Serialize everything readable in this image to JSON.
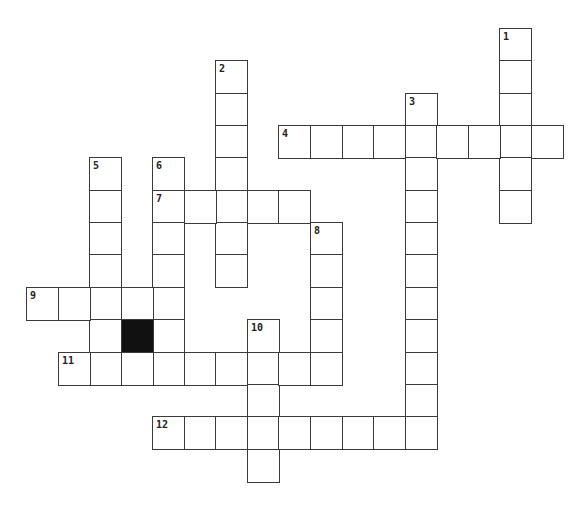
{
  "puzzle": {
    "type": "crossword",
    "grid": {
      "origin_x": 26,
      "origin_y": 28,
      "pitch_x": 31.55,
      "pitch_y": 32.35
    },
    "black_cells": [
      {
        "col": 3,
        "row": 9
      }
    ],
    "entries": [
      {
        "number": "1",
        "direction": "down",
        "col": 15,
        "row": 0,
        "length": 6
      },
      {
        "number": "2",
        "direction": "down",
        "col": 6,
        "row": 1,
        "length": 7
      },
      {
        "number": "3",
        "direction": "down",
        "col": 12,
        "row": 2,
        "length": 11
      },
      {
        "number": "4",
        "direction": "across",
        "col": 8,
        "row": 3,
        "length": 9
      },
      {
        "number": "5",
        "direction": "down",
        "col": 2,
        "row": 4,
        "length": 7
      },
      {
        "number": "6",
        "direction": "down",
        "col": 4,
        "row": 4,
        "length": 7
      },
      {
        "number": "7",
        "direction": "across",
        "col": 4,
        "row": 5,
        "length": 5
      },
      {
        "number": "8",
        "direction": "down",
        "col": 9,
        "row": 6,
        "length": 5
      },
      {
        "number": "9",
        "direction": "across",
        "col": 0,
        "row": 8,
        "length": 5
      },
      {
        "number": "10",
        "direction": "down",
        "col": 7,
        "row": 9,
        "length": 5
      },
      {
        "number": "11",
        "direction": "across",
        "col": 1,
        "row": 10,
        "length": 9
      },
      {
        "number": "12",
        "direction": "across",
        "col": 4,
        "row": 12,
        "length": 9
      }
    ],
    "colors": {
      "cell_border": "#3a3a3a",
      "cell_fill": "#ffffff",
      "black_cell": "#111111",
      "number_text": "#222222"
    }
  }
}
